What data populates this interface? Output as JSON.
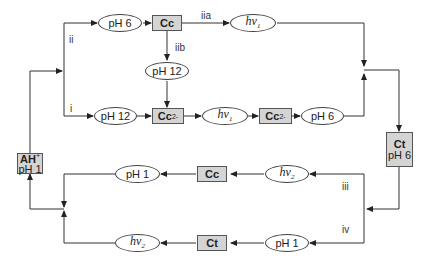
{
  "diagram": {
    "type": "reaction-network",
    "nodes": {
      "ah_plus": {
        "main": "AH",
        "sup": "+",
        "sub_label": "pH 1"
      },
      "top_ph6": "pH 6",
      "top_cc": "Cc",
      "top_hv1": {
        "h": "h",
        "nu": "ν",
        "sub": "1"
      },
      "mid_ph12": "pH 12",
      "bot_ph12": "pH 12",
      "bot_cc2_a": {
        "main": "Cc",
        "sup": "2-"
      },
      "bot_hv1": {
        "h": "h",
        "nu": "ν",
        "sub": "1"
      },
      "bot_cc2_b": {
        "main": "Cc",
        "sup": "2-"
      },
      "bot_ph6": "pH 6",
      "ct_ph6": {
        "main": "Ct",
        "sub_label": "pH 6"
      },
      "low_ph1": "pH 1",
      "low_cc": "Cc",
      "low_hv2": {
        "h": "h",
        "nu": "ν",
        "sub": "2"
      },
      "lowest_hv2": {
        "h": "h",
        "nu": "ν",
        "sub": "2"
      },
      "lowest_ct": "Ct",
      "lowest_ph1": "pH 1"
    },
    "path_labels": {
      "ii": "ii",
      "i": "i",
      "iia": "iia",
      "iib": "iib",
      "iii": "iii",
      "iv": "iv"
    },
    "colors": {
      "line": "#333333",
      "box_fill": "#d4d4d4",
      "ellipse_fill": "#ffffff"
    }
  }
}
